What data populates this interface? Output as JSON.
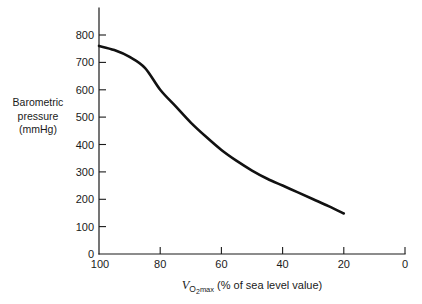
{
  "chart_data": {
    "type": "line",
    "title": "",
    "subtitle": "",
    "xlabel_parts": {
      "symbol": "V",
      "subscript_o": "O",
      "subscript_2": "2",
      "subscript_max": "max",
      "rest": "(% of sea level value)"
    },
    "xlabel": "VO2max (% of sea level value)",
    "ylabel_lines": [
      "Barometric",
      "pressure",
      "(mmHg)"
    ],
    "ylabel": "Barometric pressure (mmHg)",
    "x": [
      100,
      95,
      90,
      85,
      80,
      75,
      70,
      65,
      60,
      55,
      50,
      45,
      40,
      35,
      30,
      25,
      20
    ],
    "y": [
      760,
      745,
      720,
      680,
      600,
      540,
      480,
      428,
      380,
      340,
      305,
      275,
      250,
      225,
      200,
      175,
      148
    ],
    "series": [
      {
        "name": "barometric-pressure",
        "values": [
          760,
          745,
          720,
          680,
          600,
          540,
          480,
          428,
          380,
          340,
          305,
          275,
          250,
          225,
          200,
          175,
          148
        ],
        "color": "#111111"
      }
    ],
    "xticks": [
      100,
      80,
      60,
      40,
      20,
      0
    ],
    "xticklabels": [
      "100",
      "80",
      "60",
      "40",
      "20",
      "0"
    ],
    "yticks": [
      0,
      100,
      200,
      300,
      400,
      500,
      600,
      700,
      800
    ],
    "yticklabels": [
      "0",
      "100",
      "200",
      "300",
      "400",
      "500",
      "600",
      "700",
      "800"
    ],
    "xlim": [
      100,
      0
    ],
    "ylim": [
      0,
      800
    ],
    "x_axis_reversed": true,
    "grid": false,
    "legend": "none",
    "annotations": []
  },
  "figure": {
    "background_color": "#ffffff",
    "line_color": "#111111",
    "axis_color": "#1a1a1a"
  }
}
